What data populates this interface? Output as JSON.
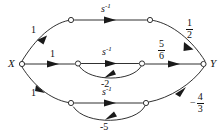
{
  "figure": {
    "type": "signal-flow-graph",
    "nodes": {
      "source": {
        "id": "X",
        "label": "X",
        "x": 18,
        "y": 64
      },
      "sink": {
        "id": "Y",
        "label": "Y",
        "x": 207,
        "y": 64
      },
      "intermediate": [
        {
          "id": "n1",
          "x": 71,
          "y": 20
        },
        {
          "id": "n2",
          "x": 150,
          "y": 20
        },
        {
          "id": "n3",
          "x": 78,
          "y": 63
        },
        {
          "id": "n4",
          "x": 142,
          "y": 63
        },
        {
          "id": "n5",
          "x": 71,
          "y": 103
        },
        {
          "id": "n6",
          "x": 146,
          "y": 103
        }
      ]
    },
    "branch_labels": {
      "top_entry": "1",
      "top_transmittance_base": "s",
      "top_transmittance_exp": "-1",
      "top_exit_num": "1",
      "top_exit_den": "2",
      "mid_entry": "1",
      "mid_transmittance_base": "s",
      "mid_transmittance_exp": "-1",
      "mid_feedback": "-2",
      "mid_exit_num": "5",
      "mid_exit_den": "6",
      "bot_entry": "1",
      "bot_transmittance_base": "s",
      "bot_transmittance_exp": "-1",
      "bot_feedback": "-5",
      "bot_exit_sign": "−",
      "bot_exit_num": "4",
      "bot_exit_den": "3"
    },
    "colors": {
      "stroke": "#1a1a1a",
      "text": "#111111",
      "background": "#ffffff",
      "node_fill": "#ffffff"
    }
  }
}
